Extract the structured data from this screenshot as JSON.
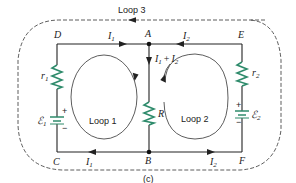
{
  "diagram": {
    "type": "circuit",
    "caption": "(c)",
    "nodes": {
      "A": "A",
      "B": "B",
      "C": "C",
      "D": "D",
      "E": "E",
      "F": "F"
    },
    "components": {
      "r1": "r",
      "r1_sub": "1",
      "r2": "r",
      "r2_sub": "2",
      "R": "R",
      "emf1": "ℰ",
      "emf1_sub": "1",
      "emf2": "ℰ",
      "emf2_sub": "2",
      "plus": "+",
      "minus": "−"
    },
    "currents": {
      "top_left": "I",
      "top_left_sub": "1",
      "top_right": "I",
      "top_right_sub": "2",
      "middle_a": "I",
      "middle_a_sub": "1",
      "middle_plus": "+",
      "middle_b": "I",
      "middle_b_sub": "2",
      "bottom_left": "I",
      "bottom_left_sub": "1",
      "bottom_right": "I",
      "bottom_right_sub": "2"
    },
    "loops": {
      "loop1": "Loop 1",
      "loop2": "Loop 2",
      "loop3": "Loop 3"
    },
    "colors": {
      "wire": "#222222",
      "resistor": "#2e8b6b",
      "battery": "#2e8b6b",
      "background": "#ffffff"
    }
  }
}
